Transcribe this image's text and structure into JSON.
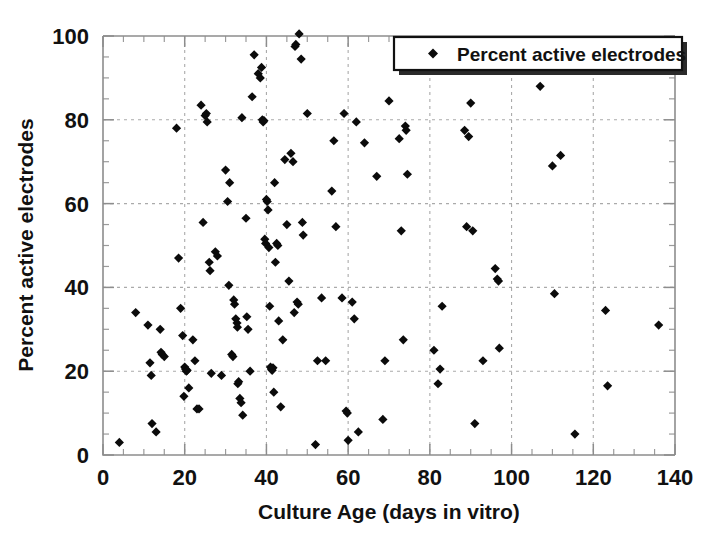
{
  "figure": {
    "background": "#ffffff",
    "marker_color": "#0b0b0b",
    "grid_color": "#aaaaaa",
    "frame_color": "#8d8d8d"
  },
  "legend": {
    "label": "Percent active electrodes",
    "marker_icon": "diamond-marker-icon",
    "position": "top-right"
  },
  "axes": {
    "x_title": "Culture Age (days in vitro)",
    "y_title": "Percent active electrodes",
    "x_ticks": [
      "0",
      "20",
      "40",
      "60",
      "80",
      "100",
      "120",
      "140"
    ],
    "y_ticks": [
      "0",
      "20",
      "40",
      "60",
      "80",
      "100"
    ]
  },
  "chart_data": {
    "type": "scatter",
    "title": "",
    "xlabel": "Culture Age (days in vitro)",
    "ylabel": "Percent active electrodes",
    "xlim": [
      0,
      140
    ],
    "ylim": [
      0,
      100
    ],
    "xticks": [
      0,
      20,
      40,
      60,
      80,
      100,
      120,
      140
    ],
    "yticks": [
      0,
      20,
      40,
      60,
      80,
      100
    ],
    "xminor_step": 5,
    "yminor_step": 5,
    "grid": true,
    "grid_style": "dashed",
    "legend": "Percent active electrodes",
    "legend_position": "upper right",
    "marker": "diamond",
    "series": [
      {
        "name": "Percent active electrodes",
        "points": [
          [
            4.0,
            3.0
          ],
          [
            8.0,
            34.0
          ],
          [
            11.0,
            31.0
          ],
          [
            11.5,
            22.0
          ],
          [
            11.8,
            19.0
          ],
          [
            12.0,
            7.5
          ],
          [
            13.0,
            5.5
          ],
          [
            14.0,
            30.0
          ],
          [
            14.2,
            24.5
          ],
          [
            14.5,
            24.0
          ],
          [
            15.0,
            23.5
          ],
          [
            18.0,
            78.0
          ],
          [
            18.5,
            47.0
          ],
          [
            19.0,
            35.0
          ],
          [
            19.5,
            28.5
          ],
          [
            19.8,
            14.0
          ],
          [
            20.0,
            21.0
          ],
          [
            20.2,
            20.5
          ],
          [
            20.4,
            20.0
          ],
          [
            20.6,
            20.2
          ],
          [
            21.0,
            16.0
          ],
          [
            22.0,
            27.5
          ],
          [
            22.5,
            22.5
          ],
          [
            23.0,
            11.0
          ],
          [
            23.5,
            11.0
          ],
          [
            24.0,
            83.5
          ],
          [
            24.5,
            55.5
          ],
          [
            25.0,
            81.0
          ],
          [
            25.3,
            81.5
          ],
          [
            25.5,
            79.5
          ],
          [
            26.0,
            46.0
          ],
          [
            26.2,
            44.0
          ],
          [
            26.5,
            19.5
          ],
          [
            27.5,
            48.5
          ],
          [
            28.0,
            47.5
          ],
          [
            29.0,
            19.0
          ],
          [
            30.0,
            68.0
          ],
          [
            30.5,
            60.5
          ],
          [
            30.8,
            40.5
          ],
          [
            31.0,
            65.0
          ],
          [
            31.5,
            24.0
          ],
          [
            31.8,
            23.5
          ],
          [
            32.0,
            37.0
          ],
          [
            32.2,
            36.0
          ],
          [
            32.5,
            32.5
          ],
          [
            32.8,
            31.5
          ],
          [
            32.9,
            30.5
          ],
          [
            33.0,
            17.0
          ],
          [
            33.2,
            17.5
          ],
          [
            33.5,
            13.5
          ],
          [
            33.8,
            12.5
          ],
          [
            34.0,
            80.5
          ],
          [
            34.2,
            9.5
          ],
          [
            35.0,
            56.5
          ],
          [
            35.2,
            33.0
          ],
          [
            35.5,
            30.0
          ],
          [
            36.0,
            20.0
          ],
          [
            36.5,
            85.5
          ],
          [
            37.0,
            95.5
          ],
          [
            38.0,
            91.0
          ],
          [
            38.5,
            90.0
          ],
          [
            38.8,
            92.5
          ],
          [
            39.0,
            80.0
          ],
          [
            39.2,
            79.5
          ],
          [
            39.4,
            79.8
          ],
          [
            39.6,
            51.5
          ],
          [
            39.8,
            50.5
          ],
          [
            40.0,
            61.0
          ],
          [
            40.2,
            60.5
          ],
          [
            40.4,
            58.5
          ],
          [
            40.6,
            49.5
          ],
          [
            40.8,
            35.5
          ],
          [
            41.0,
            21.0
          ],
          [
            41.2,
            20.5
          ],
          [
            41.4,
            20.2
          ],
          [
            41.6,
            20.8
          ],
          [
            41.8,
            15.0
          ],
          [
            42.0,
            65.0
          ],
          [
            42.2,
            46.0
          ],
          [
            42.5,
            50.5
          ],
          [
            42.8,
            50.0
          ],
          [
            43.0,
            32.0
          ],
          [
            43.5,
            11.5
          ],
          [
            44.0,
            27.5
          ],
          [
            44.5,
            70.5
          ],
          [
            45.0,
            55.0
          ],
          [
            45.5,
            41.5
          ],
          [
            46.0,
            72.0
          ],
          [
            46.5,
            70.0
          ],
          [
            46.8,
            34.0
          ],
          [
            47.0,
            97.5
          ],
          [
            47.2,
            98.0
          ],
          [
            47.5,
            36.5
          ],
          [
            47.8,
            36.0
          ],
          [
            48.0,
            100.5
          ],
          [
            48.5,
            94.5
          ],
          [
            48.8,
            55.5
          ],
          [
            49.0,
            52.5
          ],
          [
            50.0,
            81.5
          ],
          [
            52.0,
            2.5
          ],
          [
            52.5,
            22.5
          ],
          [
            53.5,
            37.5
          ],
          [
            54.5,
            22.5
          ],
          [
            56.0,
            63.0
          ],
          [
            56.5,
            75.0
          ],
          [
            57.0,
            54.5
          ],
          [
            58.5,
            37.5
          ],
          [
            59.0,
            81.5
          ],
          [
            59.5,
            10.5
          ],
          [
            59.8,
            10.0
          ],
          [
            60.0,
            3.5
          ],
          [
            61.0,
            36.5
          ],
          [
            61.5,
            32.5
          ],
          [
            62.0,
            79.5
          ],
          [
            62.5,
            5.5
          ],
          [
            64.0,
            74.5
          ],
          [
            67.0,
            66.5
          ],
          [
            68.5,
            8.5
          ],
          [
            69.0,
            22.5
          ],
          [
            70.0,
            84.5
          ],
          [
            72.5,
            75.5
          ],
          [
            73.0,
            53.5
          ],
          [
            73.5,
            27.5
          ],
          [
            74.0,
            78.5
          ],
          [
            74.2,
            77.5
          ],
          [
            74.5,
            67.0
          ],
          [
            81.0,
            25.0
          ],
          [
            82.0,
            17.0
          ],
          [
            82.5,
            20.5
          ],
          [
            83.0,
            35.5
          ],
          [
            88.5,
            77.5
          ],
          [
            89.0,
            54.5
          ],
          [
            89.5,
            76.0
          ],
          [
            90.0,
            84.0
          ],
          [
            90.5,
            53.5
          ],
          [
            91.0,
            7.5
          ],
          [
            93.0,
            22.5
          ],
          [
            96.0,
            44.5
          ],
          [
            96.5,
            42.0
          ],
          [
            96.8,
            41.5
          ],
          [
            97.0,
            25.5
          ],
          [
            107.0,
            88.0
          ],
          [
            110.0,
            69.0
          ],
          [
            110.5,
            38.5
          ],
          [
            112.0,
            71.5
          ],
          [
            115.5,
            5.0
          ],
          [
            123.0,
            34.5
          ],
          [
            123.5,
            16.5
          ],
          [
            136.0,
            31.0
          ]
        ]
      }
    ]
  }
}
